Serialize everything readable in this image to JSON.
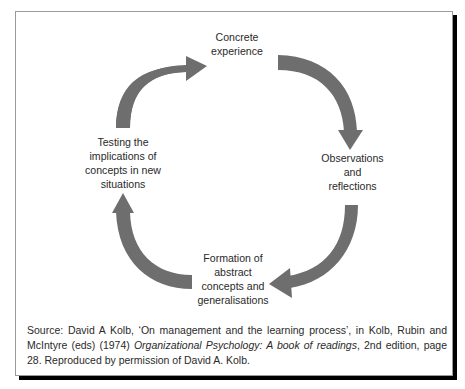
{
  "diagram": {
    "arrow_color": "#6e6e6e",
    "stages": [
      {
        "id": "concrete",
        "lines": [
          "Concrete",
          "experience"
        ]
      },
      {
        "id": "observations",
        "lines": [
          "Observations",
          "and",
          "reflections"
        ]
      },
      {
        "id": "formation",
        "lines": [
          "Formation of",
          "abstract",
          "concepts and",
          "generalisations"
        ]
      },
      {
        "id": "testing",
        "lines": [
          "Testing the",
          "implications of",
          "concepts in new",
          "situations"
        ]
      }
    ],
    "cycle_order": [
      "concrete",
      "observations",
      "formation",
      "testing"
    ]
  },
  "source": {
    "prefix": "Source: David A Kolb, ‘On management and the learning process’, in Kolb, Rubin and McIntyre (eds) (1974) ",
    "book_title": "Organizational Psychology: A book of readings",
    "suffix": ", 2nd edition, page 28. Reproduced by permission of David A. Kolb."
  }
}
